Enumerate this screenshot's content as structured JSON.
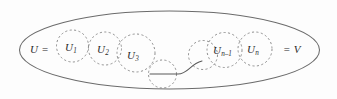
{
  "figure": {
    "name": "filtration-chain-diagram",
    "background_color": "#fdfdfd",
    "outline_color": "#6b6b6b",
    "dash_color": "#8a8a8a",
    "text_color": "#2b2b2b"
  },
  "outer_set": {
    "shape": "ellipse",
    "left_label": "U",
    "left_equals": "=",
    "right_equals": "=",
    "right_label": "V"
  },
  "subsets": [
    {
      "key": "u1",
      "label": "U",
      "subscript": "1"
    },
    {
      "key": "u2",
      "label": "U",
      "subscript": "2"
    },
    {
      "key": "u3",
      "label": "U",
      "subscript": "3"
    },
    {
      "key": "mid_unlabeled",
      "label": "",
      "subscript": ""
    },
    {
      "key": "gap_unlabeled",
      "label": "",
      "subscript": ""
    },
    {
      "key": "un_minus_1",
      "label": "U",
      "subscript": "n–1"
    },
    {
      "key": "un",
      "label": "U",
      "subscript": "n"
    }
  ],
  "connector": {
    "name": "ellipsis-connector-curve",
    "description": "curved line bridging the left chain to the right chain"
  }
}
